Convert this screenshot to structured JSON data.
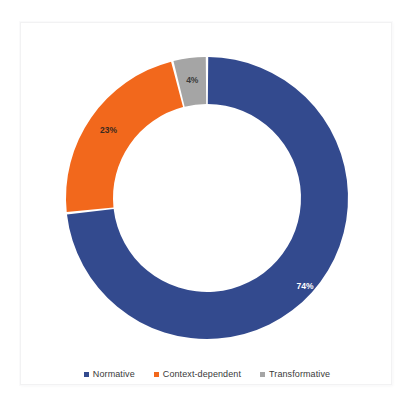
{
  "chart_data": {
    "type": "pie",
    "variant": "donut",
    "title": "",
    "xlabel": "",
    "ylabel": "",
    "categories": [
      "Normative",
      "Context-dependent",
      "Transformative"
    ],
    "values": [
      74,
      23,
      4
    ],
    "unit": "%",
    "data_labels": [
      "74%",
      "23%",
      "4%"
    ],
    "colors": [
      "#334A8E",
      "#F2681C",
      "#A5A5A5"
    ],
    "label_text_colors": [
      "#ffffff",
      "#3a2a20",
      "#3a3a3a"
    ],
    "legend": {
      "position": "bottom",
      "entries": [
        {
          "label": "Normative",
          "color": "#334A8E",
          "marker": "square-swatch"
        },
        {
          "label": "Context-dependent",
          "color": "#F2681C",
          "marker": "square-swatch"
        },
        {
          "label": "Transformative",
          "color": "#A5A5A5",
          "marker": "square-swatch"
        }
      ]
    },
    "geometry": {
      "center_x": 186,
      "center_y": 175,
      "outer_radius": 141,
      "inner_radius": 94,
      "start_angle_deg": 0,
      "direction": "clockwise",
      "slice_gap_deg": 1.0
    },
    "grid": false
  },
  "card": {
    "background": "#ffffff",
    "border_color": "#f2f2f3"
  }
}
